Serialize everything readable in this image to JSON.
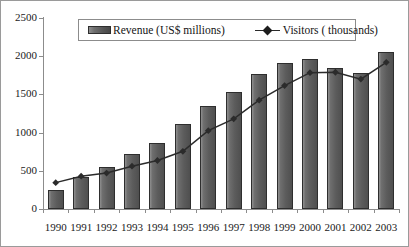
{
  "chart_data": {
    "type": "bar",
    "title": "",
    "subtitle": "",
    "xlabel": "",
    "ylabel": "",
    "ylim": [
      0,
      2500
    ],
    "ytick_step": 500,
    "yticks": [
      "0",
      "500",
      "1000",
      "1500",
      "2000",
      "2500"
    ],
    "grid": false,
    "legend_position": "top-center",
    "categories": [
      "1990",
      "1991",
      "1992",
      "1993",
      "1994",
      "1995",
      "1996",
      "1997",
      "1998",
      "1999",
      "2000",
      "2001",
      "2002",
      "2003"
    ],
    "series": [
      {
        "name": "Revenue (US$ millions)",
        "type": "bar",
        "color": "#5c5c5c",
        "values": [
          250,
          420,
          555,
          720,
          865,
          1115,
          1350,
          1530,
          1765,
          1910,
          1965,
          1845,
          1780,
          2060
        ]
      },
      {
        "name": "Visitors ( thousands)",
        "type": "line",
        "color": "#2b2b2b",
        "marker": "diamond",
        "values": [
          345,
          430,
          470,
          560,
          635,
          755,
          1025,
          1180,
          1425,
          1615,
          1785,
          1790,
          1700,
          1920
        ]
      }
    ]
  },
  "legend": {
    "revenue_label": "Revenue (US$ millions)",
    "visitors_label": "Visitors ( thousands)"
  },
  "colors": {
    "bar_fill": "#5c5c5c",
    "bar_edge": "#2e2e2e",
    "line": "#2b2b2b",
    "axis": "#8c8c8c",
    "text": "#1a1a1a",
    "frame": "#9a9a9a",
    "background": "#ffffff"
  }
}
